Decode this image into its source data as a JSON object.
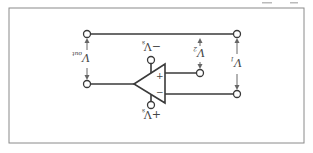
{
  "diagram": {
    "orientation": "rotated-180",
    "labels": {
      "v_out": "V",
      "v_out_sub": "out",
      "v1": "V",
      "v1_sub": "1",
      "v2": "V",
      "v2_sub": "2",
      "neg_supply": "−V",
      "neg_supply_sub": "s",
      "pos_supply": "+V",
      "pos_supply_sub": "s",
      "plus_input": "+",
      "minus_input": "−"
    },
    "colors": {
      "line": "#3a3a3a",
      "frame": "#8a8a8a",
      "arrow": "#666666",
      "background": "#ffffff"
    }
  }
}
